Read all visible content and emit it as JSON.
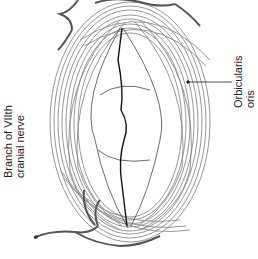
{
  "diagram": {
    "orientation": "rotated 90 degrees counter-clockwise",
    "labels": {
      "nerve": {
        "line1": "Branch of VIIth",
        "line2": "cranial nerve"
      },
      "muscle": {
        "line1": "Orbicularis",
        "line2": "oris"
      }
    },
    "colors": {
      "muscle_fibers": "#8a8a8a",
      "nerve": "#555555",
      "mouth_line": "#111111",
      "label_text": "#222222",
      "background": "#ffffff"
    }
  }
}
